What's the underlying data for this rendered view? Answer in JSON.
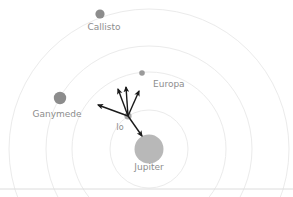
{
  "diagram": {
    "background_color": "#ffffff",
    "orbit_color": "#ebebeb",
    "label_color": "#8d8d8d",
    "arrow_color": "#1a1a1a",
    "divider_color": "#dcdcdc",
    "center": {
      "x": 149,
      "y": 149
    },
    "bodies": [
      {
        "id": "jupiter",
        "label": "Jupiter",
        "x": 149,
        "y": 149,
        "radius": 14.5,
        "color": "#b8b8b8",
        "label_x": 149,
        "label_y": 170,
        "label_anchor": "middle"
      },
      {
        "id": "io",
        "label": "Io",
        "x": 128,
        "y": 116,
        "radius": 3.6,
        "color": "#a8a8a8",
        "label_x": 120,
        "label_y": 130,
        "label_anchor": "middle"
      },
      {
        "id": "europa",
        "label": "Europa",
        "x": 142,
        "y": 73,
        "radius": 2.8,
        "color": "#9a9a9a",
        "label_x": 153,
        "label_y": 87,
        "label_anchor": "start"
      },
      {
        "id": "ganymede",
        "label": "Ganymede",
        "x": 60,
        "y": 98,
        "radius": 6.2,
        "color": "#8c8c8c",
        "label_x": 57,
        "label_y": 117,
        "label_anchor": "middle"
      },
      {
        "id": "callisto",
        "label": "Callisto",
        "x": 100,
        "y": 14,
        "radius": 4.6,
        "color": "#8c8c8c",
        "label_x": 104,
        "label_y": 30,
        "label_anchor": "middle"
      }
    ],
    "orbits": [
      {
        "id": "orbit-io",
        "radius": 39
      },
      {
        "id": "orbit-europa",
        "radius": 77
      },
      {
        "id": "orbit-ganymede",
        "radius": 103
      },
      {
        "id": "orbit-callisto",
        "radius": 140
      }
    ],
    "force_vectors": [
      {
        "id": "force-to-jupiter",
        "from_x": 128,
        "from_y": 116,
        "to_x": 142,
        "to_y": 136
      },
      {
        "id": "force-to-ganymede",
        "from_x": 128,
        "from_y": 116,
        "to_x": 98,
        "to_y": 105
      },
      {
        "id": "force-vector-up-left",
        "from_x": 128,
        "from_y": 116,
        "to_x": 118,
        "to_y": 89
      },
      {
        "id": "force-vector-up",
        "from_x": 128,
        "from_y": 116,
        "to_x": 125,
        "to_y": 86
      },
      {
        "id": "force-to-europa",
        "from_x": 128,
        "from_y": 116,
        "to_x": 138,
        "to_y": 91
      }
    ],
    "divider": {
      "y": 189
    }
  }
}
